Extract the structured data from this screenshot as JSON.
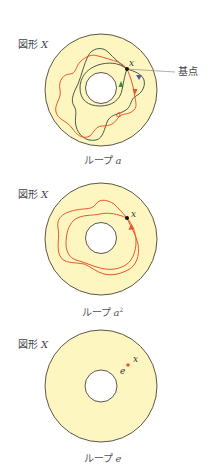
{
  "colors": {
    "annulus_fill": "#fdf6c0",
    "outline": "#4a4438",
    "loop_a": "#e8572e",
    "loop_other": "#4b5a4a",
    "arrow_green": "#3f8a3a",
    "arrow_blue": "#5a5a9a",
    "base_point": "#111111",
    "identity_point": "#e8572e",
    "leader_line": "#999999"
  },
  "figures": [
    {
      "id": "loop-a",
      "space_label": "図形",
      "space_var": "X",
      "point_label": "x",
      "annotation": "基点",
      "caption_prefix": "ループ",
      "caption_var": "a",
      "caption_sup": "",
      "loop_label": "a"
    },
    {
      "id": "loop-a-squared",
      "space_label": "図形",
      "space_var": "X",
      "point_label": "x",
      "caption_prefix": "ループ",
      "caption_var": "a",
      "caption_sup": "2"
    },
    {
      "id": "loop-e",
      "space_label": "図形",
      "space_var": "X",
      "point_label": "x",
      "constant_label": "e",
      "caption_prefix": "ループ",
      "caption_var": "e",
      "caption_sup": ""
    }
  ]
}
